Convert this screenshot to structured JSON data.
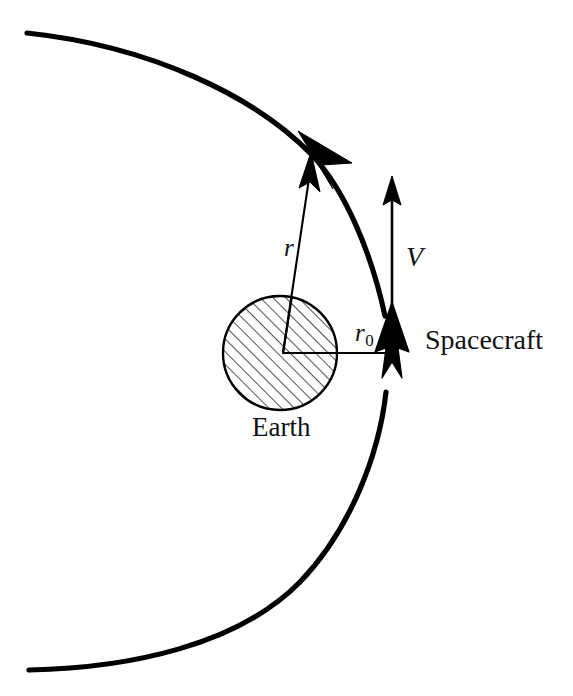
{
  "figure": {
    "domain": "diagram",
    "background_color": "#ffffff",
    "stroke_color": "#000000",
    "text_color": "#111111",
    "width": 573,
    "height": 696
  },
  "labels": {
    "radius_vector": "r",
    "perigee_radius_symbol": "r",
    "perigee_radius_subscript": "0",
    "velocity": "V",
    "central_body": "Earth",
    "vehicle": "Spacecraft"
  },
  "elements": {
    "orbit_name": "hyperbolic-orbit-curve",
    "earth_name": "earth-hatched-circle",
    "radius_vector_name": "radius-vector-arrow",
    "perigee_line_name": "perigee-radius-line",
    "velocity_arrow_name": "velocity-vector-arrow",
    "spacecraft_marker_name": "spacecraft-arrow-marker"
  },
  "geometry": {
    "earth_center": [
      280,
      353
    ],
    "earth_radius": 57,
    "perigee_point": [
      392,
      353
    ],
    "orbit_top_start": [
      27,
      33
    ],
    "orbit_bottom_end": [
      29,
      670
    ],
    "radius_vector_tip": [
      322,
      160
    ],
    "velocity_arrow_tail": [
      392,
      353
    ],
    "velocity_arrow_tip": [
      392,
      176
    ],
    "hatch_angle_deg": 45,
    "hatch_spacing": 9
  }
}
